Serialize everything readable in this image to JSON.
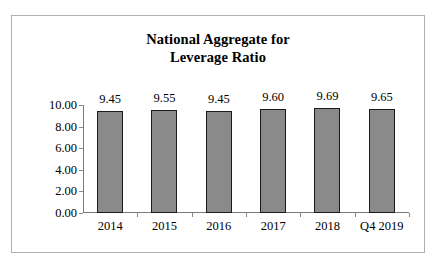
{
  "chart_data": {
    "type": "bar",
    "title": "National Aggregate for Leverage Ratio",
    "title_lines": [
      "National Aggregate for",
      "Leverage Ratio"
    ],
    "categories": [
      "2014",
      "2015",
      "2016",
      "2017",
      "2018",
      "Q4 2019"
    ],
    "values": [
      9.45,
      9.55,
      9.45,
      9.6,
      9.69,
      9.65
    ],
    "value_labels": [
      "9.45",
      "9.55",
      "9.45",
      "9.60",
      "9.69",
      "9.65"
    ],
    "xlabel": "",
    "ylabel": "",
    "ylim": [
      0,
      10
    ],
    "ytick_values": [
      0,
      2,
      4,
      6,
      8,
      10
    ],
    "ytick_labels": [
      "0.00",
      "2.00",
      "4.00",
      "6.00",
      "8.00",
      "10.00"
    ],
    "grid": false,
    "legend": false,
    "series": [
      {
        "name": "Leverage Ratio",
        "values": [
          9.45,
          9.55,
          9.45,
          9.6,
          9.69,
          9.65
        ]
      }
    ],
    "colors": {
      "bar_fill": "#8a8a8a",
      "bar_border": "#1a1a1a",
      "axis": "#7a7a7a",
      "text": "#000000",
      "frame": "#b0b0b0",
      "background": "#ffffff"
    }
  }
}
